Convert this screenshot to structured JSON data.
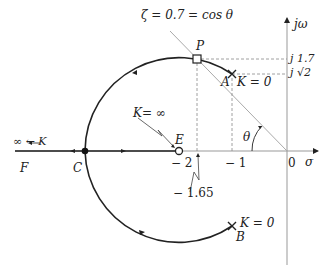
{
  "diagram": {
    "type": "root-locus",
    "title_line_label": "ζ = 0.7 = cos θ",
    "axes": {
      "imag_label": "jω",
      "real_label": "σ",
      "origin_label": "0"
    },
    "imag_ticks": [
      "j 1.7",
      "j √2"
    ],
    "real_ticks": [
      "− 2",
      "− 1",
      "− 1.65"
    ],
    "points": {
      "P": "P",
      "A": "A",
      "B": "B",
      "C": "C",
      "E": "E",
      "F": "F"
    },
    "annotations": {
      "A_gain": "K = 0",
      "B_gain": "K = 0",
      "E_gain": "K= ∞",
      "F_gain": "∞ ← K",
      "angle": "θ"
    }
  }
}
